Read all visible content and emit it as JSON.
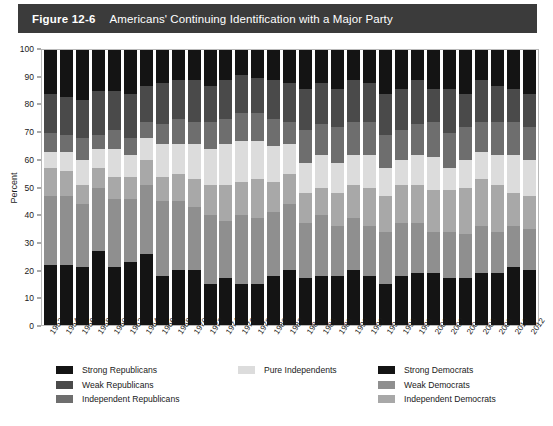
{
  "figure": {
    "number": "Figure 12-6",
    "title": "Americans' Continuing Identification with a Major Party"
  },
  "source_note": "",
  "axis": {
    "y_label": "Percent",
    "y_ticks": [
      "0",
      "10",
      "20",
      "30",
      "40",
      "50",
      "60",
      "70",
      "80",
      "90",
      "100"
    ]
  },
  "legend": {
    "column1": [
      {
        "label": "Strong Republicans",
        "color": "#141414"
      },
      {
        "label": "Weak Republicans",
        "color": "#4a4a4a"
      },
      {
        "label": "Independent Republicans",
        "color": "#6e6e6e"
      }
    ],
    "column2": [
      {
        "label": "Pure Independents",
        "color": "#dcdcdc"
      }
    ],
    "column3": [
      {
        "label": "Strong Democrats",
        "color": "#141414"
      },
      {
        "label": "Weak Democrats",
        "color": "#8f8f8f"
      },
      {
        "label": "Independent Democrats",
        "color": "#a8a8a8"
      }
    ]
  },
  "chart_data": {
    "type": "bar",
    "stacked": true,
    "stack_total": 100,
    "title": "Americans' Continuing Identification with a Major Party",
    "xlabel": "",
    "ylabel": "Percent",
    "ylim": [
      0,
      100
    ],
    "ytick_step": 10,
    "grid": false,
    "legend_position": "below",
    "stack_order_bottom_to_top": [
      "Strong Democrats",
      "Weak Democrats",
      "Independent Democrats",
      "Pure Independents",
      "Independent Republicans",
      "Weak Republicans",
      "Strong Republicans"
    ],
    "categories": [
      "1952",
      "1954",
      "1956",
      "1958",
      "1960",
      "1962",
      "1964",
      "1966",
      "1968",
      "1970",
      "1972",
      "1974",
      "1976",
      "1978",
      "1980",
      "1982",
      "1984",
      "1986",
      "1988",
      "1990",
      "1992",
      "1994",
      "1996",
      "1998",
      "2000",
      "2002",
      "2004",
      "2006",
      "2008",
      "2010",
      "2012"
    ],
    "series": [
      {
        "name": "Strong Democrats",
        "color": "#141414",
        "values": [
          22,
          22,
          21,
          27,
          21,
          23,
          26,
          18,
          20,
          20,
          15,
          17,
          15,
          15,
          18,
          20,
          17,
          18,
          18,
          20,
          18,
          15,
          18,
          19,
          19,
          17,
          17,
          19,
          19,
          21,
          20
        ]
      },
      {
        "name": "Weak Democrats",
        "color": "#8f8f8f",
        "values": [
          25,
          25,
          23,
          23,
          25,
          23,
          25,
          27,
          25,
          23,
          25,
          21,
          25,
          24,
          23,
          24,
          20,
          22,
          18,
          19,
          18,
          19,
          19,
          18,
          15,
          17,
          16,
          17,
          15,
          15,
          15
        ]
      },
      {
        "name": "Independent Democrats",
        "color": "#a8a8a8",
        "values": [
          10,
          9,
          7,
          7,
          8,
          8,
          9,
          9,
          10,
          10,
          11,
          13,
          12,
          14,
          11,
          11,
          11,
          10,
          12,
          12,
          14,
          13,
          14,
          14,
          15,
          15,
          17,
          17,
          17,
          12,
          12
        ]
      },
      {
        "name": "Pure Independents",
        "color": "#dcdcdc",
        "values": [
          6,
          7,
          9,
          7,
          10,
          8,
          8,
          12,
          11,
          13,
          13,
          15,
          15,
          14,
          13,
          11,
          11,
          12,
          11,
          11,
          12,
          10,
          9,
          11,
          12,
          8,
          10,
          10,
          11,
          14,
          13
        ]
      },
      {
        "name": "Independent Republicans",
        "color": "#6e6e6e",
        "values": [
          7,
          6,
          8,
          5,
          7,
          6,
          6,
          7,
          9,
          8,
          10,
          9,
          10,
          10,
          10,
          8,
          12,
          11,
          13,
          12,
          12,
          12,
          11,
          11,
          13,
          13,
          12,
          11,
          12,
          12,
          12
        ]
      },
      {
        "name": "Weak Republicans",
        "color": "#4a4a4a",
        "values": [
          14,
          14,
          14,
          16,
          14,
          16,
          13,
          15,
          14,
          15,
          13,
          14,
          14,
          13,
          14,
          14,
          15,
          15,
          14,
          15,
          14,
          15,
          15,
          16,
          12,
          16,
          12,
          15,
          13,
          12,
          12
        ]
      },
      {
        "name": "Strong Republicans",
        "color": "#141414",
        "values": [
          16,
          17,
          18,
          15,
          15,
          16,
          13,
          12,
          11,
          11,
          13,
          11,
          9,
          10,
          11,
          12,
          14,
          12,
          14,
          11,
          12,
          16,
          14,
          11,
          14,
          14,
          16,
          11,
          13,
          14,
          16
        ]
      }
    ]
  }
}
